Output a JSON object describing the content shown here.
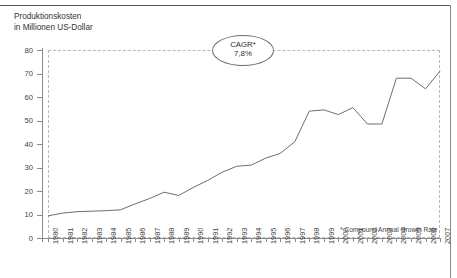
{
  "title": {
    "line1": "Produktionskosten",
    "line2": "in Millionen US-Dollar"
  },
  "callout": {
    "label": "CAGR*",
    "value": "7,8%"
  },
  "footnote": "* Compound Annual Growth Rate",
  "colors": {
    "line": "#6e6e6e",
    "axis": "#8c8c8c",
    "grid": "#b9b9b9",
    "text": "#3f3f3f",
    "background": "#ffffff"
  },
  "chart_data": {
    "type": "line",
    "title": "Produktionskosten in Millionen US-Dollar",
    "xlabel": "",
    "ylabel": "in Millionen US-Dollar",
    "xlim": [
      1980,
      2007
    ],
    "ylim": [
      0,
      80
    ],
    "yticks": [
      0,
      10,
      20,
      30,
      40,
      50,
      60,
      70,
      80
    ],
    "grid": false,
    "dashed_frame": true,
    "legend": null,
    "annotations": [
      {
        "text": "CAGR*",
        "value": "7,8%",
        "shape": "ellipse",
        "x": 1994,
        "y": 80
      },
      {
        "text": "* Compound Annual Growth Rate",
        "x": 2000,
        "y": 7
      }
    ],
    "categories": [
      "1980",
      "1981",
      "1982",
      "1983",
      "1984",
      "1985",
      "1986",
      "1987",
      "1988",
      "1989",
      "1990",
      "1991",
      "1992",
      "1993",
      "1994",
      "1995",
      "1996",
      "1997",
      "1998",
      "1999",
      "2000",
      "2001",
      "2002",
      "2003",
      "2004",
      "2005",
      "2006",
      "2007"
    ],
    "x": [
      1980,
      1981,
      1982,
      1983,
      1984,
      1985,
      1986,
      1987,
      1988,
      1989,
      1990,
      1991,
      1992,
      1993,
      1994,
      1995,
      1996,
      1997,
      1998,
      1999,
      2000,
      2001,
      2002,
      2003,
      2004,
      2005,
      2006,
      2007
    ],
    "values": [
      9.4,
      10.6,
      11.2,
      11.4,
      11.6,
      12.0,
      14.5,
      16.8,
      19.5,
      18.1,
      21.5,
      24.5,
      28.0,
      30.5,
      31.0,
      34.0,
      36.0,
      41.0,
      54.0,
      54.5,
      52.5,
      55.5,
      48.5,
      48.5,
      68.0,
      68.0,
      63.5,
      64.5
    ],
    "values_note": "Values read off the y-axis (Millionen US-Dollar); 2007 endpoint rises to approx. 71"
  }
}
